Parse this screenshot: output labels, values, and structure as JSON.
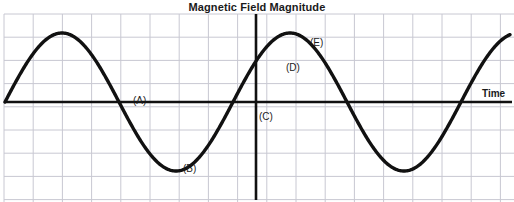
{
  "figure": {
    "title": "Magnetic Field Magnitude",
    "x_axis_label": "Time",
    "background_color": "#ffffff",
    "grid_color": "#c8c8d2",
    "curve_color": "#111111",
    "axis_color": "#111111"
  },
  "labels": {
    "a": "(A)",
    "b": "(B)",
    "c": "(C)",
    "d": "(D)",
    "e": "(E)"
  },
  "chart_data": {
    "type": "line",
    "title": "Magnetic Field Magnitude",
    "xlabel": "Time",
    "ylabel": "Magnetic Field Magnitude",
    "grid": true,
    "legend": "none",
    "xlim": [
      0,
      514
    ],
    "ylim": [
      -1.15,
      1.15
    ],
    "waveform": {
      "shape": "sine",
      "amplitude": 1.0,
      "period_px": 228,
      "zero_line_y_px": 102,
      "peak_y_px": 33,
      "trough_y_px": 176,
      "start_x_px": 5,
      "end_x_px": 510,
      "phase_note": "rises from zero at left edge, positive first half-cycle"
    },
    "series": [
      {
        "name": "Magnetic field B(t)",
        "points_px": [
          [
            5,
            102
          ],
          [
            14,
            84
          ],
          [
            25,
            62
          ],
          [
            36,
            47
          ],
          [
            48,
            38
          ],
          [
            60,
            34
          ],
          [
            70,
            33
          ],
          [
            82,
            36
          ],
          [
            94,
            45
          ],
          [
            106,
            58
          ],
          [
            118,
            74
          ],
          [
            130,
            91
          ],
          [
            141,
            104
          ],
          [
            152,
            122
          ],
          [
            163,
            139
          ],
          [
            174,
            155
          ],
          [
            185,
            169
          ],
          [
            196,
            176
          ],
          [
            207,
            176
          ],
          [
            218,
            170
          ],
          [
            229,
            157
          ],
          [
            240,
            140
          ],
          [
            250,
            120
          ],
          [
            256,
            102
          ],
          [
            262,
            90
          ],
          [
            272,
            70
          ],
          [
            283,
            53
          ],
          [
            294,
            41
          ],
          [
            305,
            34
          ],
          [
            316,
            32
          ],
          [
            327,
            35
          ],
          [
            338,
            44
          ],
          [
            349,
            58
          ],
          [
            360,
            74
          ],
          [
            371,
            92
          ],
          [
            382,
            110
          ],
          [
            393,
            130
          ],
          [
            404,
            148
          ],
          [
            415,
            163
          ],
          [
            426,
            172
          ],
          [
            437,
            176
          ],
          [
            448,
            176
          ],
          [
            459,
            170
          ],
          [
            470,
            158
          ],
          [
            481,
            142
          ],
          [
            492,
            125
          ],
          [
            502,
            110
          ],
          [
            510,
            100
          ]
        ]
      }
    ],
    "annotations": [
      {
        "text": "(A)",
        "x_px": 133,
        "y_px": 95,
        "meaning": "descending zero crossing, first"
      },
      {
        "text": "(B)",
        "x_px": 183,
        "y_px": 163,
        "meaning": "first trough / minimum"
      },
      {
        "text": "(C)",
        "x_px": 259,
        "y_px": 111,
        "meaning": "ascending zero crossing at origin"
      },
      {
        "text": "(D)",
        "x_px": 286,
        "y_px": 62,
        "meaning": "rising portion of second positive lobe"
      },
      {
        "text": "(E)",
        "x_px": 310,
        "y_px": 37,
        "meaning": "second peak / maximum"
      }
    ],
    "axes": {
      "horizontal_axis_y_px": 102,
      "vertical_axis_x_px": 256,
      "horizontal_axis_x_start_px": 4,
      "horizontal_axis_x_end_px": 512,
      "vertical_axis_y_start_px": 14,
      "vertical_axis_y_end_px": 200
    },
    "gridlines": {
      "vertical_spacing_px": 29.2,
      "horizontal_spacing_px": 23.2,
      "vertical_start_px": 4,
      "horizontal_start_px": 14
    }
  }
}
